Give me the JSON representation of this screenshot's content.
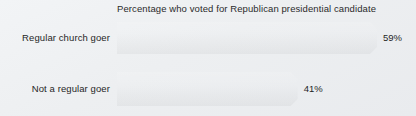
{
  "chart_data": {
    "type": "bar",
    "orientation": "horizontal",
    "title": "Percentage who voted for Republican presidential candidate",
    "xlabel": "",
    "ylabel": "",
    "xlim": [
      0,
      100
    ],
    "grid": false,
    "legend": null,
    "unit": "%",
    "categories": [
      "Regular church goer",
      "Not a regular goer"
    ],
    "values": [
      59,
      41
    ],
    "value_labels": [
      "59%",
      "41%"
    ],
    "bars": [
      {
        "category": "Regular church goer",
        "value": 59,
        "value_label": "59%",
        "bar_px_start": 117,
        "bar_px_end": 377,
        "bar_width_pct": "100%"
      },
      {
        "category": "Not a regular goer",
        "value": 41,
        "value_label": "41%",
        "bar_px_start": 117,
        "bar_px_end": 296,
        "bar_width_pct": "68.8%"
      }
    ],
    "colors": {
      "background": "#eef0f2",
      "bar_gradient_start": "#f5bcb0",
      "bar_gradient_mid": "#e8704f",
      "bar_gradient_end": "#d31c0b",
      "title_text": "#2b2b2b",
      "category_text": "#262626",
      "value_text": "#1f1f1f"
    }
  }
}
